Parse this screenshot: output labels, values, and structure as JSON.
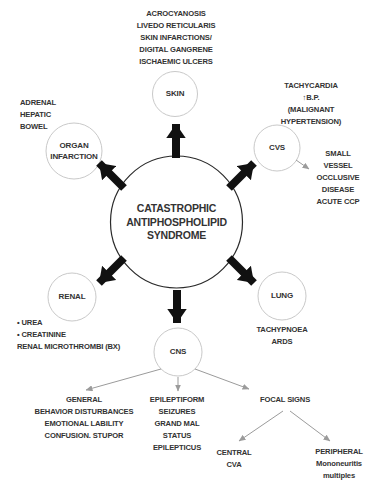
{
  "diagram": {
    "title": "CATASTROPHIC\nANTIPHOSPHOLIPID\nSYNDROME",
    "nodes": {
      "skin": {
        "label": "SKIN"
      },
      "organ": {
        "label": "ORGAN\nINFARCTION"
      },
      "cvs": {
        "label": "CVS"
      },
      "renal": {
        "label": "RENAL"
      },
      "lung": {
        "label": "LUNG"
      },
      "cns": {
        "label": "CNS"
      }
    },
    "annotations": {
      "skin": "ACROCYANOSIS\nLIVEDO RETICULARIS\nSKIN INFARCTIONS/\nDIGITAL GANGRENE\nISCHAEMIC ULCERS",
      "organ": "ADRENAL\nHEPATIC\nBOWEL",
      "cvs_top": "TACHYCARDIA\n↑B.P. (MALIGNANT\nHYPERTENSION)",
      "cvs_side": "SMALL\nVESSEL\nOCCLUSIVE\nDISEASE\nACUTE CCP",
      "renal": "• UREA\n• CREATININE\nRENAL MICROTHROMBI (BX)",
      "lung": "TACHYPNOEA\nARDS",
      "cns_general": "GENERAL\nBEHAVIOR DISTURBANCES\nEMOTIONAL LABILITY\nCONFUSION. STUPOR",
      "cns_epileptiform": "EPILEPTIFORM\nSEIZURES\nGRAND MAL\nSTATUS\nEPILEPTICUS",
      "cns_focal": "FOCAL SIGNS",
      "focal_central": "CENTRAL\nCVA",
      "focal_peripheral": "PERIPHERAL\nMononeuritis\nmultiples"
    },
    "colors": {
      "arrow": "#111111",
      "node_outline": "#c9c9c9",
      "center_outline": "#2a2a2a",
      "connector_line": "#9b9b9b",
      "text": "#333333",
      "background": "#ffffff"
    }
  }
}
